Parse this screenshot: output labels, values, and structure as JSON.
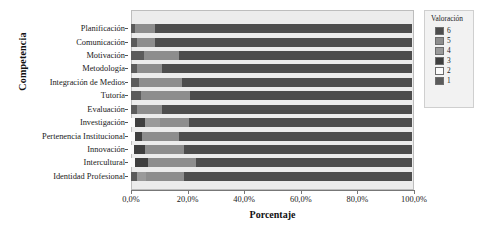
{
  "chart_data": {
    "type": "bar",
    "orientation": "horizontal",
    "stacked": true,
    "normalized": "100%",
    "title": "",
    "xlabel": "Porcentaje",
    "ylabel": "Competencia",
    "xlim": [
      0,
      100
    ],
    "xticks": [
      0,
      20,
      40,
      60,
      80,
      100
    ],
    "xticklabels": [
      "0,0%",
      "20,0%",
      "40,0%",
      "60,0%",
      "80,0%",
      "100,0%"
    ],
    "grid": false,
    "legend": {
      "title": "Valoración",
      "position": "right",
      "entries": [
        {
          "label": "6",
          "color": "#4d4d4d"
        },
        {
          "label": "5",
          "color": "#8d8d8d"
        },
        {
          "label": "4",
          "color": "#9a9a9a"
        },
        {
          "label": "3",
          "color": "#3f3f3f"
        },
        {
          "label": "2",
          "color": "#fbfbfb"
        },
        {
          "label": "1",
          "color": "#5b5b5b"
        }
      ]
    },
    "categories": [
      "Planificación",
      "Comunicación",
      "Motivación",
      "Metodología",
      "Integración de Medios",
      "Tutoría",
      "Evaluación",
      "Investigación",
      "Pertenencia Institucional",
      "Innovación",
      "Intercultural",
      "Identidad Profesional"
    ],
    "series": [
      {
        "name": "1",
        "color": "#5b5b5b",
        "values": [
          1.5,
          2.0,
          4.5,
          2.0,
          3.0,
          3.5,
          2.0,
          0.0,
          0.0,
          0.0,
          0.0,
          2.0
        ]
      },
      {
        "name": "2",
        "color": "#fbfbfb",
        "values": [
          0.0,
          0.0,
          0.0,
          0.0,
          0.0,
          0.0,
          0.0,
          1.5,
          1.5,
          1.0,
          1.5,
          0.0
        ]
      },
      {
        "name": "3",
        "color": "#3f3f3f",
        "values": [
          0.0,
          0.0,
          0.0,
          0.0,
          0.0,
          0.0,
          0.0,
          3.5,
          2.5,
          4.0,
          4.5,
          0.0
        ]
      },
      {
        "name": "4",
        "color": "#9a9a9a",
        "values": [
          0.0,
          0.0,
          0.0,
          0.0,
          0.0,
          0.0,
          0.0,
          5.5,
          0.0,
          0.0,
          0.0,
          3.5
        ]
      },
      {
        "name": "5",
        "color": "#8d8d8d",
        "values": [
          7.0,
          6.5,
          12.5,
          9.0,
          15.0,
          17.5,
          9.0,
          10.0,
          13.0,
          14.0,
          17.0,
          13.5
        ]
      },
      {
        "name": "6",
        "color": "#4d4d4d",
        "values": [
          91.5,
          91.5,
          83.0,
          89.0,
          82.0,
          79.0,
          89.0,
          79.5,
          83.0,
          81.0,
          77.0,
          81.0
        ]
      }
    ]
  }
}
